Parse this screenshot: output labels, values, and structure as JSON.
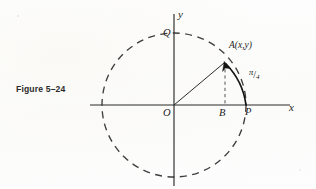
{
  "figure": {
    "caption": "Figure 5–24"
  },
  "axes": {
    "x_label": "x",
    "y_label": "y"
  },
  "points": {
    "origin": "O",
    "top": "Q",
    "foot": "B",
    "right": "P",
    "moving": "A(x,y)"
  },
  "angle": {
    "numerator": "π",
    "slash": "/",
    "denominator": "4",
    "full": "π/4"
  },
  "geometry": {
    "center_x": 174,
    "center_y": 105,
    "radius": 72,
    "point_a_x": 225,
    "point_a_y": 62,
    "point_b_x": 225,
    "point_p_x": 246,
    "point_q_y": 33,
    "angle_degrees": 45,
    "x_axis_start": 90,
    "x_axis_end": 290,
    "y_axis_start": 14,
    "y_axis_end": 186
  },
  "colors": {
    "ink": "#1d1d1d",
    "line": "#3a3a3a",
    "paper": "#fdfdfc",
    "caption": "#2b2b2b"
  }
}
